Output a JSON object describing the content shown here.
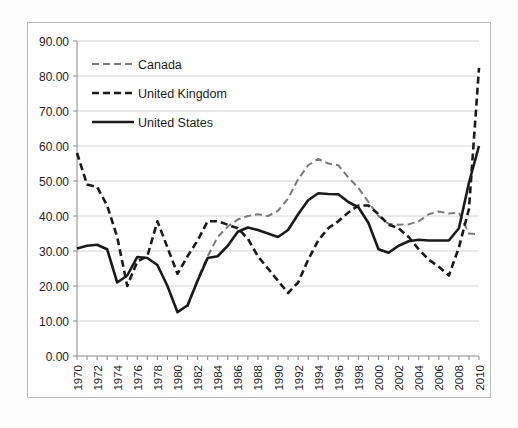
{
  "chart_data": {
    "type": "line",
    "title": "",
    "xlabel": "",
    "ylabel": "",
    "x": [
      1970,
      1971,
      1972,
      1973,
      1974,
      1975,
      1976,
      1977,
      1978,
      1979,
      1980,
      1981,
      1982,
      1983,
      1984,
      1985,
      1986,
      1987,
      1988,
      1989,
      1990,
      1991,
      1992,
      1993,
      1994,
      1995,
      1996,
      1997,
      1998,
      1999,
      2000,
      2001,
      2002,
      2003,
      2004,
      2005,
      2006,
      2007,
      2008,
      2009,
      2010
    ],
    "xlim": [
      1970,
      2010
    ],
    "ylim": [
      0,
      90
    ],
    "ytick_step": 10,
    "ytick_labels": [
      "0.00",
      "10.00",
      "20.00",
      "30.00",
      "40.00",
      "50.00",
      "60.00",
      "70.00",
      "80.00",
      "90.00"
    ],
    "xtick_labels": [
      "1970",
      "1972",
      "1974",
      "1976",
      "1978",
      "1980",
      "1982",
      "1984",
      "1986",
      "1988",
      "1990",
      "1992",
      "1994",
      "1996",
      "1998",
      "2000",
      "2002",
      "2004",
      "2006",
      "2008",
      "2010"
    ],
    "xtick_step": 2,
    "grid": "horizontal",
    "legend_position": "upper-left-inside",
    "series": [
      {
        "name": "Canada",
        "style": "dashed",
        "color": "#7a7a7a",
        "width": 2.0,
        "dash": "7,4",
        "start_year": 1981,
        "values": [
          null,
          null,
          null,
          null,
          null,
          null,
          null,
          null,
          null,
          null,
          null,
          14.0,
          22.0,
          28.5,
          34.0,
          37.0,
          39.0,
          40.0,
          40.5,
          40.0,
          41.5,
          45.0,
          50.5,
          54.5,
          56.3,
          55.0,
          54.5,
          51.0,
          48.0,
          44.0,
          40.0,
          37.8,
          37.5,
          37.6,
          38.5,
          40.5,
          41.3,
          40.7,
          41.0,
          35.0,
          34.8
        ]
      },
      {
        "name": "United Kingdom",
        "style": "dashed",
        "color": "#1a1a1a",
        "width": 2.6,
        "dash": "7,4",
        "start_year": 1970,
        "values": [
          58.0,
          49.0,
          48.3,
          43.0,
          34.0,
          20.0,
          27.0,
          28.5,
          38.5,
          31.0,
          23.5,
          28.5,
          33.0,
          38.5,
          38.5,
          37.5,
          36.5,
          33.5,
          28.5,
          25.0,
          21.5,
          18.0,
          21.0,
          27.5,
          33.0,
          36.5,
          38.5,
          41.0,
          43.0,
          43.0,
          40.5,
          37.5,
          36.5,
          34.0,
          30.5,
          27.5,
          25.5,
          23.0,
          31.0,
          42.0,
          82.3
        ]
      },
      {
        "name": "United States",
        "style": "solid",
        "color": "#1a1a1a",
        "width": 2.6,
        "dash": "none",
        "start_year": 1970,
        "values": [
          30.7,
          31.5,
          31.8,
          30.5,
          21.0,
          23.0,
          28.3,
          28.0,
          26.0,
          20.0,
          12.5,
          14.5,
          21.5,
          28.0,
          28.5,
          31.5,
          35.5,
          36.7,
          36.0,
          35.0,
          34.0,
          36.0,
          40.5,
          44.5,
          46.5,
          46.3,
          46.2,
          44.0,
          42.5,
          38.0,
          30.5,
          29.5,
          31.5,
          32.8,
          33.2,
          33.0,
          33.0,
          33.0,
          36.5,
          49.5,
          60.0
        ]
      }
    ]
  },
  "legend": {
    "items": [
      {
        "label": "Canada"
      },
      {
        "label": "United Kingdom"
      },
      {
        "label": "United States"
      }
    ]
  },
  "colors": {
    "canada": "#7a7a7a",
    "united_kingdom": "#1a1a1a",
    "united_states": "#1a1a1a",
    "gridline": "#c9c9c9",
    "axis": "#8a8a8a",
    "frame": "#b9b9b9",
    "text": "#1c1c1c",
    "background": "#ffffff"
  }
}
